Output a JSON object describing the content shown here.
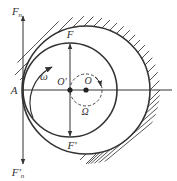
{
  "diagram": {
    "labels": {
      "Fn_top": "F",
      "Fn_top_sub": "n",
      "Fn_bottom": "F'",
      "Fn_bottom_sub": "n",
      "F": "F",
      "F_prime": "F'",
      "A": "A",
      "O_prime": "O'",
      "O": "O",
      "omega": "ω",
      "Omega": "Ω"
    },
    "colors": {
      "stroke": "#333333",
      "background": "#ffffff"
    }
  }
}
